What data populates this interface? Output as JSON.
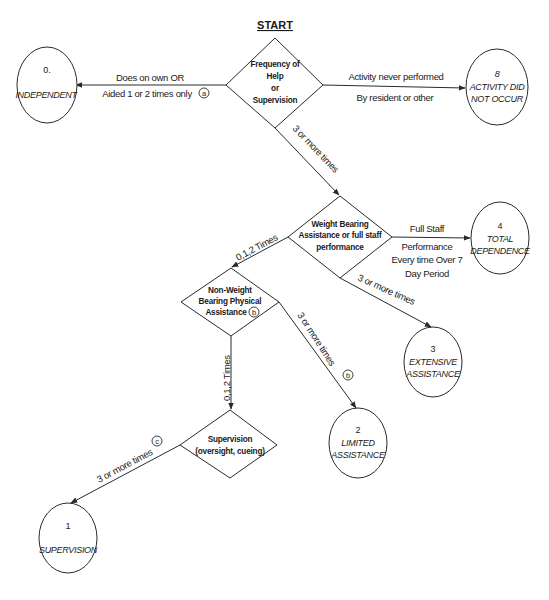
{
  "title": "START",
  "decisions": {
    "frequency": {
      "lines": [
        "Frequency of",
        "Help",
        "or",
        "Supervision"
      ]
    },
    "weight_bearing": {
      "lines": [
        "Weight Bearing",
        "Assistance or full staff",
        "performance"
      ]
    },
    "non_weight_bearing": {
      "lines": [
        "Non-Weight",
        "Bearing Physical",
        "Assistance"
      ],
      "marker": "b"
    },
    "supervision": {
      "lines": [
        "Supervision",
        "(oversight, cueing)"
      ]
    }
  },
  "outcomes": {
    "independent": {
      "code": "0.",
      "label": [
        "INDEPENDENT"
      ]
    },
    "did_not_occur": {
      "code": "8",
      "label": [
        "ACTIVITY DID",
        "NOT OCCUR"
      ]
    },
    "total_dependence": {
      "code": "4",
      "label": [
        "TOTAL",
        "DEPENDENCE"
      ]
    },
    "extensive_assistance": {
      "code": "3",
      "label": [
        "EXTENSIVE",
        "ASSISTANCE"
      ]
    },
    "limited_assistance": {
      "code": "2",
      "label": [
        "LIMITED",
        "ASSISTANCE"
      ]
    },
    "supervision": {
      "code": "1",
      "label": [
        "SUPERVISION"
      ]
    }
  },
  "edges": {
    "to_independent": {
      "lines": [
        "Does on own OR",
        "Aided 1 or 2 times only"
      ],
      "marker": "a"
    },
    "to_did_not_occur": {
      "lines": [
        "Activity never performed",
        "By resident or other"
      ]
    },
    "to_weight_bearing": {
      "label": "3 or more times"
    },
    "to_total_dependence": {
      "lines": [
        "Full Staff",
        "Performance",
        "Every time Over 7",
        "Day Period"
      ]
    },
    "to_extensive": {
      "label": "3 or more times"
    },
    "to_non_weight": {
      "label": "0,1,2 Times"
    },
    "to_limited": {
      "label": "3 or more times",
      "marker": "b"
    },
    "to_supervision_decision": {
      "label": "0,1,2 Times"
    },
    "to_supervision_outcome": {
      "label": "3 or more times",
      "marker": "c"
    }
  },
  "colors": {
    "stroke": "#2a2a2a",
    "text": "#1a1a1a",
    "background": "#ffffff"
  }
}
